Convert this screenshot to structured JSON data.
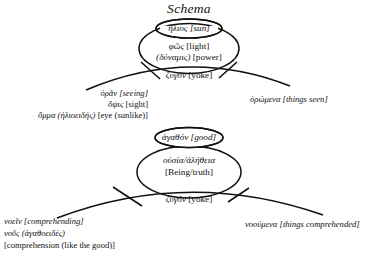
{
  "title": "Schema",
  "upper": {
    "inner_ellipse": {
      "greek": "ἥλιος",
      "english": "[sun]"
    },
    "outer_ellipse_line1": {
      "greek": "φῶς",
      "english": "[light]"
    },
    "outer_ellipse_line2": {
      "greek": "(δύναμις)",
      "english": "[power]"
    },
    "yoke": {
      "greek": "ζυγόν",
      "english": "[yoke]"
    },
    "left_lines": [
      {
        "greek": "ὁρᾶν",
        "english": "[seeing]"
      },
      {
        "greek": "ὄψις",
        "english": "[sight]"
      },
      {
        "greek": "ὄμμα (ἡλιοειδής)",
        "english": "[eye (sunlike)]"
      }
    ],
    "right_line": {
      "greek": "ὁρώμενα",
      "english": "[things seen]"
    }
  },
  "lower": {
    "inner_ellipse": {
      "greek": "ἀγαθόν",
      "english": "[good]"
    },
    "outer_ellipse_line1": {
      "greek": "οὐσία/ἀλήθεια",
      "english": ""
    },
    "outer_ellipse_line2": {
      "greek": "",
      "english": "[Being/truth]"
    },
    "yoke": {
      "greek": "ζυγόν",
      "english": "[yoke]"
    },
    "left_lines": [
      {
        "greek": "νοεῖν",
        "english": "[comprehending]"
      },
      {
        "greek": "νοῦς (ἀγαθοειδές)",
        "english": ""
      },
      {
        "greek": "",
        "english": "[comprehension (like the good)]"
      }
    ],
    "right_line": {
      "greek": "νοούμενα",
      "english": "[things comprehended]"
    }
  },
  "colors": {
    "ink": "#111111",
    "page": "#ffffff"
  }
}
